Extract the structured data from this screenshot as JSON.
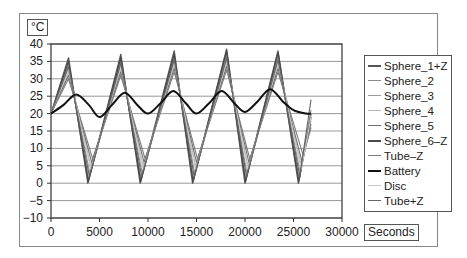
{
  "chart_data": {
    "type": "line",
    "title": "",
    "xlabel": "Seconds",
    "ylabel": "°C",
    "xlim": [
      0,
      30000
    ],
    "ylim": [
      -10,
      40
    ],
    "x_ticks": [
      "0",
      "5000",
      "10000",
      "15000",
      "20000",
      "25000",
      "30000"
    ],
    "y_ticks": [
      "40",
      "35",
      "30",
      "25",
      "20",
      "15",
      "10",
      "5",
      "0",
      "-5",
      "-10"
    ],
    "grid": "horizontal",
    "legend_position": "right",
    "series": [
      {
        "name": "Sphere_1+Z",
        "color": "#555555",
        "width": 1.4,
        "x": [
          0,
          1800,
          3800,
          7200,
          9200,
          12700,
          14600,
          18100,
          20000,
          23400,
          25500,
          26800
        ],
        "values": [
          20,
          36,
          0,
          37,
          0,
          38,
          0,
          38.5,
          0,
          38,
          0,
          20
        ]
      },
      {
        "name": "Sphere_2",
        "color": "#8a8a8a",
        "width": 1.1,
        "x": [
          0,
          1800,
          3900,
          7200,
          9300,
          12700,
          14700,
          18100,
          20100,
          23400,
          25600,
          26800
        ],
        "values": [
          20,
          34,
          1,
          35,
          1,
          36,
          1,
          37,
          1,
          36.5,
          1,
          21
        ]
      },
      {
        "name": "Sphere_3",
        "color": "#9a9a9a",
        "width": 1.1,
        "x": [
          0,
          1800,
          4000,
          7200,
          9400,
          12700,
          14800,
          18100,
          20200,
          23400,
          25700,
          26800
        ],
        "values": [
          20,
          33,
          3,
          34,
          3,
          35,
          3,
          35.5,
          3,
          35,
          3,
          20
        ]
      },
      {
        "name": "Sphere_4",
        "color": "#b5b5b5",
        "width": 1.1,
        "x": [
          0,
          1800,
          4100,
          7200,
          9500,
          12700,
          14900,
          18100,
          20300,
          23400,
          25800,
          26800
        ],
        "values": [
          20,
          32,
          5,
          33,
          5,
          34,
          5,
          34.5,
          5,
          34,
          5,
          18
        ]
      },
      {
        "name": "Sphere_5",
        "color": "#707070",
        "width": 1.1,
        "x": [
          0,
          1800,
          4200,
          7200,
          9600,
          12700,
          15000,
          18100,
          20400,
          23400,
          25900,
          26800
        ],
        "values": [
          20,
          31,
          6,
          32,
          6,
          33,
          6,
          33.5,
          6,
          33,
          6,
          17
        ]
      },
      {
        "name": "Sphere_6-Z",
        "color": "#4a4a4a",
        "width": 1.3,
        "x": [
          0,
          1800,
          3850,
          7200,
          9250,
          12700,
          14650,
          18100,
          20050,
          23400,
          25550,
          26800
        ],
        "values": [
          20,
          35,
          0.5,
          36,
          0.5,
          37,
          0.5,
          38,
          0.5,
          37.5,
          0.5,
          19
        ]
      },
      {
        "name": "Tube-Z",
        "color": "#7a7a7a",
        "width": 1.1,
        "x": [
          0,
          1800,
          4300,
          7200,
          9700,
          12700,
          15100,
          18100,
          20500,
          23400,
          26000,
          26800
        ],
        "values": [
          20,
          30,
          7,
          31,
          7,
          32,
          7,
          32.5,
          7,
          32,
          8,
          16
        ]
      },
      {
        "name": "Battery",
        "color": "#111111",
        "width": 2.0,
        "x": [
          0,
          1300,
          2600,
          3900,
          5000,
          6300,
          7600,
          8900,
          10000,
          11300,
          12600,
          13900,
          15000,
          16300,
          17600,
          18900,
          20000,
          21300,
          22600,
          23900,
          25000,
          26300,
          26800
        ],
        "values": [
          20,
          22.5,
          25.5,
          22.5,
          19,
          22.5,
          26,
          22.5,
          20,
          23,
          26.5,
          23,
          20,
          23,
          26.5,
          23,
          20.5,
          23.5,
          27,
          23.5,
          21,
          20,
          20
        ]
      },
      {
        "name": "Disc",
        "color": "#c8c8c8",
        "width": 1.1,
        "x": [
          0,
          1800,
          4100,
          7200,
          9500,
          12700,
          14900,
          18100,
          20300,
          23400,
          25800,
          26800
        ],
        "values": [
          20,
          32.5,
          4,
          33.5,
          4,
          34.5,
          4,
          35,
          4,
          34.5,
          4,
          19
        ]
      },
      {
        "name": "Tube+Z",
        "color": "#666666",
        "width": 1.1,
        "x": [
          0,
          1800,
          3950,
          7200,
          9350,
          12700,
          14750,
          18100,
          20150,
          23400,
          25650,
          26800
        ],
        "values": [
          20,
          33.5,
          2,
          34.5,
          2,
          35.5,
          2,
          36,
          2,
          35.5,
          2,
          24
        ]
      }
    ]
  },
  "axes": {
    "y_unit": "°C",
    "x_unit": "Seconds"
  },
  "legend": {
    "items": [
      {
        "label": "Sphere_1+Z",
        "color": "#555555",
        "weight": 2
      },
      {
        "label": "Sphere_2",
        "color": "#8a8a8a",
        "weight": 1
      },
      {
        "label": "Sphere_3",
        "color": "#9a9a9a",
        "weight": 1
      },
      {
        "label": "Sphere_4",
        "color": "#b5b5b5",
        "weight": 1
      },
      {
        "label": "Sphere_5",
        "color": "#707070",
        "weight": 1.5
      },
      {
        "label": "Sphere_6-Z",
        "color": "#4a4a4a",
        "weight": 2
      },
      {
        "label": "Tube-Z",
        "color": "#7a7a7a",
        "weight": 1.5
      },
      {
        "label": "Battery",
        "color": "#111111",
        "weight": 2.5
      },
      {
        "label": "Disc",
        "color": "#c8c8c8",
        "weight": 1
      },
      {
        "label": "Tube+Z",
        "color": "#666666",
        "weight": 1.5
      }
    ]
  }
}
